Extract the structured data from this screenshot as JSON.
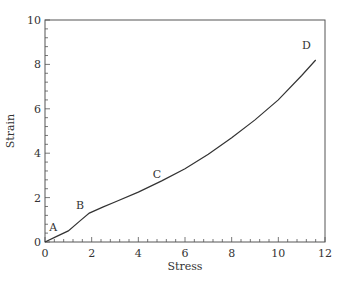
{
  "chart_data": {
    "type": "line",
    "title": "",
    "xlabel": "Stress",
    "ylabel": "Strain",
    "xlim": [
      0,
      12
    ],
    "ylim": [
      0,
      10
    ],
    "grid": false,
    "legend": null,
    "x_ticks": [
      0,
      2,
      4,
      6,
      8,
      10,
      12
    ],
    "y_ticks": [
      0,
      2,
      4,
      6,
      8,
      10
    ],
    "series": [
      {
        "name": "strain-stress curve",
        "x": [
          0,
          0.5,
          1.0,
          1.5,
          1.9,
          2.5,
          3.0,
          4.0,
          5.0,
          6.0,
          7.0,
          8.0,
          9.0,
          10.0,
          11.0,
          11.6
        ],
        "y": [
          0,
          0.25,
          0.5,
          0.95,
          1.3,
          1.58,
          1.8,
          2.25,
          2.75,
          3.3,
          3.95,
          4.7,
          5.5,
          6.4,
          7.5,
          8.2
        ]
      }
    ],
    "annotations": [
      {
        "text": "A",
        "x": 0.35,
        "y": 0.5
      },
      {
        "text": "B",
        "x": 1.5,
        "y": 1.5
      },
      {
        "text": "C",
        "x": 4.8,
        "y": 2.9
      },
      {
        "text": "D",
        "x": 11.2,
        "y": 8.7
      }
    ]
  }
}
